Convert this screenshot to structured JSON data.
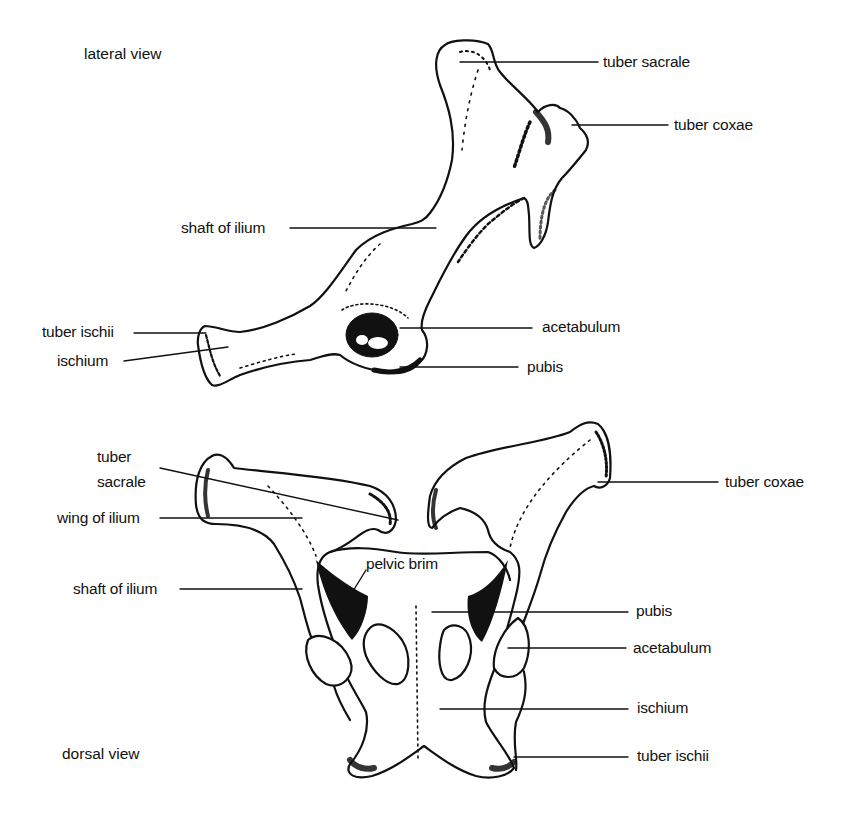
{
  "figure": {
    "background": "#ffffff",
    "ink_color": "#111111"
  },
  "lateral_view": {
    "title": "lateral view",
    "labels": {
      "tuber_sacrale": "tuber sacrale",
      "tuber_coxae": "tuber coxae",
      "shaft_of_ilium": "shaft of ilium",
      "tuber_ischii": "tuber ischii",
      "ischium": "ischium",
      "acetabulum": "acetabulum",
      "pubis": "pubis"
    }
  },
  "dorsal_view": {
    "title": "dorsal view",
    "labels": {
      "tuber_sacrale": "tuber\nsacrale",
      "wing_of_ilium": "wing of ilium",
      "shaft_of_ilium": "shaft of ilium",
      "pelvic_brim": "pelvic brim",
      "tuber_coxae": "tuber coxae",
      "pubis": "pubis",
      "acetabulum": "acetabulum",
      "ischium": "ischium",
      "tuber_ischii": "tuber ischii"
    }
  }
}
